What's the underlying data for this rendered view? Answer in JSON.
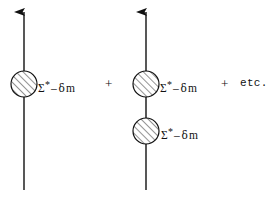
{
  "figure": {
    "background_color": "#ffffff",
    "ink_color": "#111111",
    "width": 278,
    "height": 198
  },
  "terms": [
    {
      "id": "term-1",
      "propagator": {
        "x": 24,
        "y_top": 10,
        "y_bottom": 190,
        "arrow_direction": "up"
      },
      "insertions": [
        {
          "id": "blob-1",
          "cx": 24,
          "cy": 84,
          "r": 13,
          "fill": "hatched-45",
          "label": {
            "sigma": "Σ",
            "star": "*",
            "dash": "–",
            "delta": "δ",
            "mass": "m",
            "full_text": "Σ* – δm",
            "x": 38,
            "y": 79
          }
        }
      ]
    },
    {
      "id": "term-2",
      "propagator": {
        "x": 146,
        "y_top": 10,
        "y_bottom": 190,
        "arrow_direction": "up"
      },
      "insertions": [
        {
          "id": "blob-2",
          "cx": 146,
          "cy": 84,
          "r": 13,
          "fill": "hatched-45",
          "label": {
            "sigma": "Σ",
            "star": "*",
            "dash": "–",
            "delta": "δ",
            "mass": "m",
            "full_text": "Σ* – δm",
            "x": 160,
            "y": 79
          }
        },
        {
          "id": "blob-3",
          "cx": 146,
          "cy": 131,
          "r": 13,
          "fill": "hatched-45",
          "label": {
            "sigma": "Σ",
            "star": "*",
            "dash": "–",
            "delta": "δ",
            "mass": "m",
            "full_text": "Σ* – δm",
            "x": 161,
            "y": 126
          }
        }
      ]
    }
  ],
  "operators": [
    {
      "id": "plus-1",
      "symbol": "+",
      "x": 105,
      "y": 77
    },
    {
      "id": "plus-2",
      "symbol": "+",
      "x": 221,
      "y": 77
    }
  ],
  "etc": {
    "text": "etc.",
    "x": 240,
    "y": 78
  }
}
